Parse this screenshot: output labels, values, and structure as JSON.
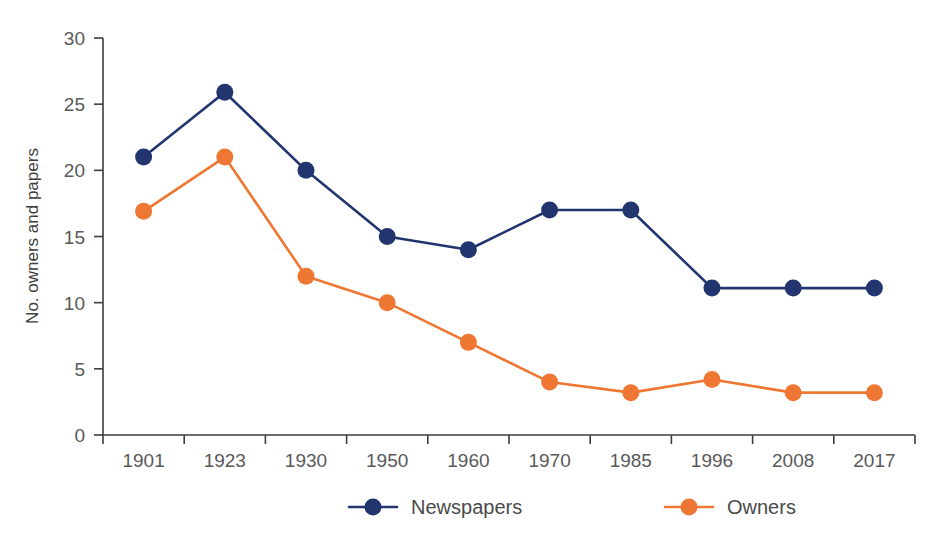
{
  "chart_data": {
    "type": "line",
    "title": "",
    "xlabel": "",
    "ylabel": "No. owners and papers",
    "categories": [
      "1901",
      "1923",
      "1930",
      "1950",
      "1960",
      "1970",
      "1985",
      "1996",
      "2008",
      "2017"
    ],
    "ylim": [
      0,
      30
    ],
    "yticks": [
      0,
      5,
      10,
      15,
      20,
      25,
      30
    ],
    "ytick_labels": [
      "0",
      "5",
      "10",
      "15",
      "20",
      "25",
      "30"
    ],
    "grid": false,
    "legend_position": "bottom",
    "series": [
      {
        "name": "Newspapers",
        "color": "#22356E",
        "values": [
          21,
          25.9,
          20,
          15,
          14,
          17,
          17,
          11.1,
          11.1,
          11.1
        ]
      },
      {
        "name": "Owners",
        "color": "#EE7733",
        "values": [
          16.9,
          21,
          12,
          10,
          7,
          4,
          3.2,
          4.2,
          3.2,
          3.2
        ]
      }
    ]
  },
  "legend": {
    "items": [
      {
        "label": "Newspapers",
        "color": "#22356E"
      },
      {
        "label": "Owners",
        "color": "#EE7733"
      }
    ]
  },
  "axes": {
    "y_title": "No. owners and papers",
    "axis_color": "#3d3d3d",
    "tick_text_color": "#595959"
  }
}
